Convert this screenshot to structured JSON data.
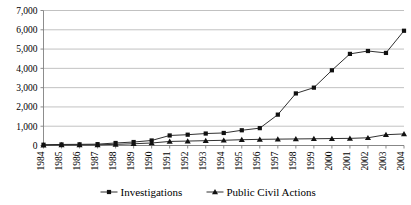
{
  "chart_data": {
    "type": "line",
    "title": "",
    "xlabel": "",
    "ylabel": "",
    "ylim": [
      0,
      7000
    ],
    "ytick_step": 1000,
    "grid": true,
    "legend_position": "bottom",
    "yticks": [
      "0",
      "1,000",
      "2,000",
      "3,000",
      "4,000",
      "5,000",
      "6,000",
      "7,000"
    ],
    "categories": [
      "1984",
      "1985",
      "1986",
      "1987",
      "1988",
      "1989",
      "1990",
      "1991",
      "1992",
      "1993",
      "1994",
      "1995",
      "1996",
      "1997",
      "1998",
      "1999",
      "2000",
      "2001",
      "2002",
      "2003",
      "2004"
    ],
    "series": [
      {
        "name": "Investigations",
        "marker": "square",
        "values": [
          40,
          55,
          60,
          70,
          130,
          180,
          260,
          520,
          560,
          620,
          650,
          790,
          900,
          1600,
          2700,
          3000,
          3900,
          4750,
          4900,
          4800,
          5950
        ]
      },
      {
        "name": "Public Civil Actions",
        "marker": "triangle",
        "values": [
          20,
          25,
          30,
          35,
          60,
          90,
          130,
          210,
          230,
          250,
          270,
          300,
          320,
          330,
          340,
          350,
          360,
          370,
          400,
          560,
          600
        ]
      }
    ]
  },
  "legend": {
    "items": [
      {
        "label": "Investigations",
        "marker": "square"
      },
      {
        "label": "Public Civil Actions",
        "marker": "triangle"
      }
    ]
  },
  "colors": {
    "series_line": "#1a1a1a",
    "marker": "#111111",
    "gridline": "#a6a6a6",
    "axis": "#808080",
    "background": "#ffffff",
    "text": "#000000"
  }
}
